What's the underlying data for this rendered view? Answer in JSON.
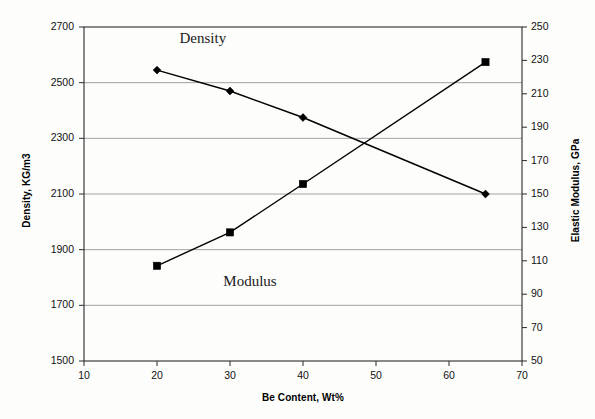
{
  "chart_data": {
    "type": "line",
    "title": "",
    "xlabel": "Be Content, Wt%",
    "ylabel": "Density, KG/m3",
    "ylabel_right": "Elastic Modulus, GPa",
    "xlim": [
      10,
      70
    ],
    "ylim": [
      1500,
      2700
    ],
    "ylim_right": [
      50,
      250
    ],
    "xticks": [
      10,
      20,
      30,
      40,
      50,
      60,
      70
    ],
    "yticks_left": [
      1500,
      1700,
      1900,
      2100,
      2300,
      2500,
      2700
    ],
    "yticks_right": [
      50,
      70,
      90,
      110,
      130,
      150,
      170,
      190,
      210,
      230,
      250
    ],
    "grid": "horizontal",
    "legend_position": "inline-annotation",
    "series": [
      {
        "name": "Density",
        "axis": "left",
        "marker": "diamond",
        "color": "#000000",
        "x": [
          20,
          30,
          40,
          65
        ],
        "values": [
          2545,
          2470,
          2375,
          2100
        ],
        "annotation": "Density",
        "annotation_x": 25,
        "annotation_y": 2655
      },
      {
        "name": "Modulus",
        "axis": "right",
        "marker": "square",
        "color": "#000000",
        "x": [
          20,
          30,
          40,
          65
        ],
        "values": [
          107,
          127,
          156,
          229
        ],
        "annotation": "Modulus",
        "annotation_x": 31,
        "annotation_y": 97
      }
    ]
  },
  "axes": {
    "x_title": "Be Content, Wt%",
    "y_left_title": "Density, KG/m3",
    "y_right_title": "Elastic Modulus, GPa",
    "x_tick_labels": [
      "10",
      "20",
      "30",
      "40",
      "50",
      "60",
      "70"
    ],
    "y_left_tick_labels": [
      "2700",
      "2500",
      "2300",
      "2100",
      "1900",
      "1700",
      "1500"
    ],
    "y_right_tick_labels": [
      "250",
      "230",
      "210",
      "190",
      "170",
      "150",
      "130",
      "110",
      "90",
      "70",
      "50"
    ]
  },
  "annotations": {
    "density_label": "Density",
    "modulus_label": "Modulus"
  },
  "colors": {
    "line": "#000000",
    "grid": "#8a8a8a",
    "axis": "#2b2b2b",
    "background": "#fdfdfc"
  }
}
